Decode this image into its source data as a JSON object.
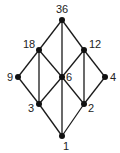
{
  "diagram": {
    "type": "hasse-diagram",
    "nodes": [
      {
        "id": "36",
        "label": "36",
        "x": 62,
        "y": 20,
        "lx": 56,
        "ly": 13
      },
      {
        "id": "18",
        "label": "18",
        "x": 39,
        "y": 50,
        "lx": 23,
        "ly": 48
      },
      {
        "id": "12",
        "label": "12",
        "x": 84,
        "y": 50,
        "lx": 89,
        "ly": 48
      },
      {
        "id": "9",
        "label": "9",
        "x": 18,
        "y": 77,
        "lx": 7,
        "ly": 81
      },
      {
        "id": "6",
        "label": "6",
        "x": 62,
        "y": 77,
        "lx": 66,
        "ly": 81
      },
      {
        "id": "4",
        "label": "4",
        "x": 105,
        "y": 77,
        "lx": 110,
        "ly": 81
      },
      {
        "id": "3",
        "label": "3",
        "x": 39,
        "y": 104,
        "lx": 28,
        "ly": 112
      },
      {
        "id": "2",
        "label": "2",
        "x": 84,
        "y": 104,
        "lx": 88,
        "ly": 112
      },
      {
        "id": "1",
        "label": "1",
        "x": 62,
        "y": 136,
        "lx": 63,
        "ly": 150
      }
    ],
    "edges": [
      [
        "36",
        "18"
      ],
      [
        "36",
        "12"
      ],
      [
        "36",
        "6"
      ],
      [
        "18",
        "9"
      ],
      [
        "18",
        "6"
      ],
      [
        "18",
        "3"
      ],
      [
        "12",
        "6"
      ],
      [
        "12",
        "4"
      ],
      [
        "12",
        "2"
      ],
      [
        "9",
        "3"
      ],
      [
        "6",
        "3"
      ],
      [
        "6",
        "2"
      ],
      [
        "6",
        "1"
      ],
      [
        "4",
        "2"
      ],
      [
        "3",
        "1"
      ],
      [
        "2",
        "1"
      ]
    ],
    "colors": {
      "line": "#1a1a1a",
      "node": "#111111"
    }
  }
}
